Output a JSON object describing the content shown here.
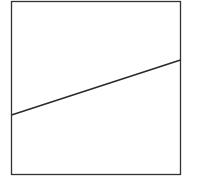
{
  "diagram": {
    "frame": {
      "x": 11.5,
      "y": 1.5,
      "width": 169,
      "height": 173,
      "stroke": "#333333"
    },
    "line": {
      "x1": 11.5,
      "y1": 115,
      "x2": 180.5,
      "y2": 60,
      "stroke": "#2a2a2a"
    }
  }
}
